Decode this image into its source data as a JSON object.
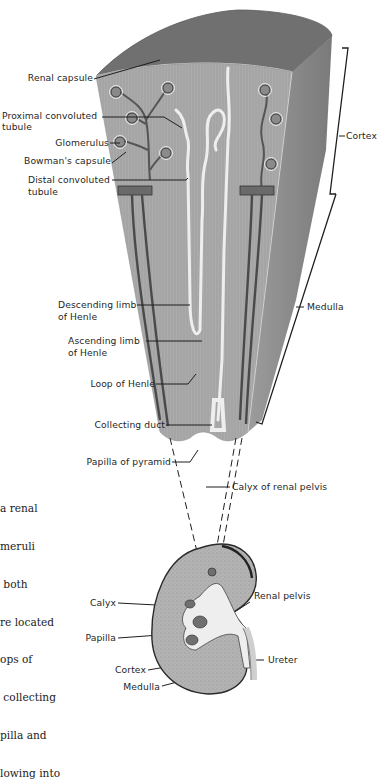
{
  "figure": {
    "colors": {
      "tissue": "#a9a9a9",
      "tissue_dark": "#7b7b7b",
      "top_surface": "#6e6e6e",
      "vessel": "#5a5a5a",
      "tubule": "#e9e9e9",
      "ink": "#1f1f1f"
    }
  },
  "labels": {
    "renal_capsule": "Renal capsule",
    "proximal_1": "Proximal convoluted",
    "proximal_2": "tubule",
    "glomerulus": "Glomerulus",
    "bowmans_capsule": "Bowman's capsule",
    "distal_1": "Distal convoluted",
    "distal_2": "tubule",
    "cortex_bracket": "Cortex",
    "medulla_bracket": "Medulla",
    "descending_1": "Descending limb",
    "descending_2": "of Henle",
    "ascending_1": "Ascending limb",
    "ascending_2": "of Henle",
    "loop_of_henle": "Loop of Henle",
    "collecting_duct": "Collecting duct",
    "papilla_of_pyramid": "Papilla of pyramid",
    "calyx_of_renal_pelvis": "Calyx of renal pelvis",
    "calyx": "Calyx",
    "papilla": "Papilla",
    "cortex": "Cortex",
    "medulla": "Medulla",
    "renal_pelvis": "Renal pelvis",
    "ureter": "Ureter"
  },
  "caption": {
    "lines": [
      "a renal",
      "meruli",
      " both",
      "re located",
      "ops of",
      " collecting",
      "pilla and",
      "lowing into"
    ]
  }
}
